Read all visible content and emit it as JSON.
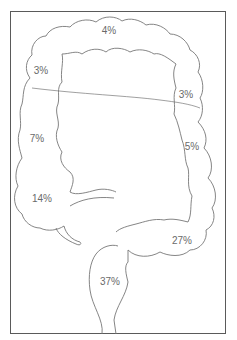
{
  "diagram": {
    "type": "anatomical-colon-distribution",
    "colors": {
      "frame": "#5a5a5a",
      "outline": "#777777",
      "label": "#6a6a6a",
      "background": "#ffffff"
    },
    "segments": [
      {
        "id": "transverse",
        "value": "4%",
        "x": 109,
        "y": 30
      },
      {
        "id": "hepatic-flexure",
        "value": "3%",
        "x": 41,
        "y": 70
      },
      {
        "id": "splenic-flexure",
        "value": "3%",
        "x": 186,
        "y": 94
      },
      {
        "id": "ascending",
        "value": "7%",
        "x": 37,
        "y": 138
      },
      {
        "id": "descending",
        "value": "5%",
        "x": 192,
        "y": 146
      },
      {
        "id": "cecum",
        "value": "14%",
        "x": 42,
        "y": 198
      },
      {
        "id": "sigmoid",
        "value": "27%",
        "x": 182,
        "y": 240
      },
      {
        "id": "rectum",
        "value": "37%",
        "x": 110,
        "y": 281
      }
    ]
  }
}
